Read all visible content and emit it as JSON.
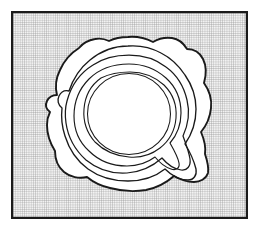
{
  "figure": {
    "kind": "contour-map",
    "title": "",
    "background_color": "#ffffff",
    "frame": {
      "name": "plot-frame",
      "x": 11,
      "y": 11,
      "width": 237,
      "height": 208,
      "border_color": "#1a1a1a",
      "border_width": 2.2,
      "fill_color": "#ffffff"
    },
    "hatch": {
      "name": "cross-hatch-fill",
      "description": "fine gray cross-hatch mesh filling the frame outside the blob",
      "line_color": "#8d8d8d",
      "line_width": 0.55,
      "spacing": 2.2,
      "base_color": "#f2f2f2"
    },
    "blob": {
      "name": "innermost-region",
      "fill_color": "#ffffff",
      "stroke_color": "#1a1a1a"
    },
    "contours": [
      {
        "name": "contour-level-1-outer",
        "level": 1,
        "stroke_color": "#1a1a1a",
        "stroke_width": 1.9,
        "shape": "irregular-lobed",
        "bbox": [
          48,
          37,
          212,
          190
        ],
        "center": [
          125,
          113
        ],
        "mean_radius": 78
      },
      {
        "name": "contour-level-2",
        "level": 2,
        "stroke_color": "#1a1a1a",
        "stroke_width": 1.35,
        "shape": "wavy-rounded",
        "bbox": [
          58,
          46,
          199,
          181
        ],
        "center": [
          126,
          113
        ],
        "mean_radius": 68
      },
      {
        "name": "contour-level-3",
        "level": 3,
        "stroke_color": "#1a1a1a",
        "stroke_width": 1.25,
        "shape": "near-circular",
        "bbox": [
          67,
          55,
          190,
          174
        ],
        "center": [
          127,
          113
        ],
        "mean_radius": 60
      },
      {
        "name": "contour-level-4",
        "level": 4,
        "stroke_color": "#1a1a1a",
        "stroke_width": 1.15,
        "shape": "near-circular",
        "bbox": [
          76,
          64,
          181,
          166
        ],
        "center": [
          128,
          113
        ],
        "mean_radius": 52
      },
      {
        "name": "contour-level-5",
        "level": 5,
        "stroke_color": "#1a1a1a",
        "stroke_width": 1.1,
        "shape": "circular",
        "bbox": [
          85,
          72,
          174,
          158
        ],
        "center": [
          129,
          114
        ],
        "mean_radius": 44
      },
      {
        "name": "contour-level-6-inner",
        "level": 6,
        "stroke_color": "#1a1a1a",
        "stroke_width": 1.05,
        "shape": "circle",
        "bbox": [
          88,
          74,
          171,
          155
        ],
        "center": [
          129,
          114
        ],
        "mean_radius": 41
      }
    ],
    "features": [
      {
        "name": "left-notch",
        "location": [
          50,
          104
        ],
        "description": "small pointed bulge on left flank"
      },
      {
        "name": "lower-right-lobe",
        "location": [
          204,
          168
        ],
        "description": "angular protrusion on lower right"
      },
      {
        "name": "top-lobes",
        "location": [
          130,
          38
        ],
        "description": "shallow wavy lobes along the top edge"
      },
      {
        "name": "flat-bottom",
        "location": [
          128,
          189
        ],
        "description": "flattened lower boundary"
      }
    ]
  }
}
